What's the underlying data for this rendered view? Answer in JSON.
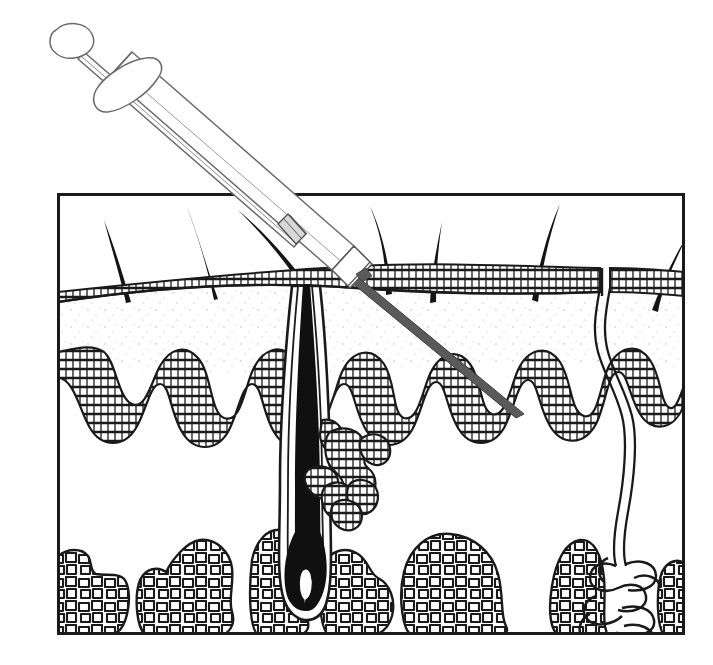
{
  "figure": {
    "type": "line-art-medical-illustration",
    "background_color": "#ffffff",
    "ink_color": "#1a1a1a",
    "fill_dermis_color": "#fdfdfd",
    "stipple_color": "#9a9a9a",
    "syringe_outline_color": "#6b6b6b",
    "needle_color": "#555555"
  },
  "frame": {
    "name": "skin-block-border",
    "x": 57,
    "y": 193,
    "width": 628,
    "height": 442,
    "stroke_width": 3
  },
  "layers": [
    {
      "id": "stratum-corneum",
      "label": "Stratum corneum",
      "depth_top": 270,
      "depth_bottom": 300
    },
    {
      "id": "epidermis",
      "label": "Epidermis",
      "depth_top": 300,
      "depth_bottom": 350
    },
    {
      "id": "dermis",
      "label": "Dermis",
      "depth_top": 350,
      "depth_bottom": 520
    },
    {
      "id": "subcutaneous-fat",
      "label": "Subcutaneous fat",
      "depth_top": 520,
      "depth_bottom": 635
    }
  ],
  "syringe": {
    "name": "syringe",
    "angle_degrees": 41,
    "plunger_thumb_x": 72,
    "plunger_thumb_y": 40,
    "needle_tip_x": 520,
    "needle_tip_y": 412,
    "entry_point_x": 362,
    "entry_point_y": 281,
    "barrel_label": "barrel",
    "flange_label": "finger-flange",
    "hub_label": "needle-hub",
    "stopper_label": "plunger-stopper"
  },
  "hairs": [
    {
      "id": "hair-1",
      "base_x": 128,
      "base_y": 300,
      "tip_x": 106,
      "tip_y": 222
    },
    {
      "id": "hair-2",
      "base_x": 214,
      "base_y": 297,
      "tip_x": 188,
      "tip_y": 207
    },
    {
      "id": "hair-3",
      "base_x": 306,
      "base_y": 288,
      "tip_x": 240,
      "tip_y": 212
    },
    {
      "id": "hair-4",
      "base_x": 388,
      "base_y": 292,
      "tip_x": 372,
      "tip_y": 208
    },
    {
      "id": "hair-5",
      "base_x": 432,
      "base_y": 300,
      "tip_x": 440,
      "tip_y": 224
    },
    {
      "id": "hair-6",
      "base_x": 528,
      "base_y": 298,
      "tip_x": 558,
      "tip_y": 206
    },
    {
      "id": "hair-7",
      "base_x": 648,
      "base_y": 308,
      "tip_x": 684,
      "tip_y": 240
    }
  ],
  "structures": {
    "hair_follicle": {
      "name": "hair-follicle",
      "shaft_x": 300,
      "bulb_y": 600,
      "has_dermal_papilla": true
    },
    "sebaceous_gland": {
      "name": "sebaceous-gland",
      "center_x": 340,
      "center_y": 470,
      "lobes": 7
    },
    "sweat_duct": {
      "name": "sweat-duct",
      "top_x": 604,
      "top_y": 290,
      "coil_x": 636,
      "coil_y": 580
    },
    "sweat_gland_coil": {
      "name": "sweat-gland-coil",
      "center_x": 638,
      "center_y": 585
    }
  },
  "fat_lobules": [
    {
      "id": "lobule-1",
      "x": 60,
      "y": 560,
      "w": 68,
      "h": 76
    },
    {
      "id": "lobule-2",
      "x": 136,
      "y": 540,
      "w": 96,
      "h": 96
    },
    {
      "id": "lobule-3",
      "x": 250,
      "y": 528,
      "w": 62,
      "h": 108
    },
    {
      "id": "lobule-4",
      "x": 320,
      "y": 548,
      "w": 72,
      "h": 88
    },
    {
      "id": "lobule-5",
      "x": 400,
      "y": 532,
      "w": 110,
      "h": 104
    },
    {
      "id": "lobule-6",
      "x": 548,
      "y": 540,
      "w": 62,
      "h": 96
    },
    {
      "id": "lobule-7",
      "x": 660,
      "y": 560,
      "w": 26,
      "h": 76
    }
  ]
}
